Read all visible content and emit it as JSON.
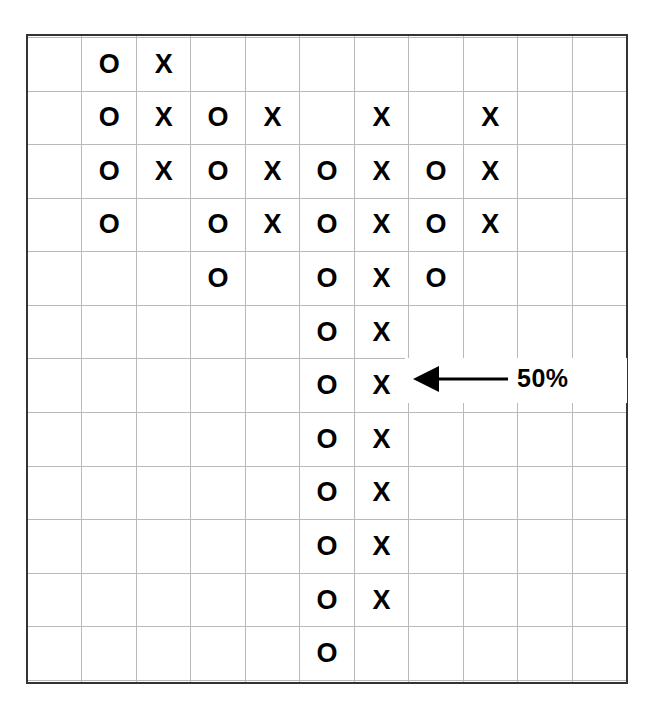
{
  "figure": {
    "kind": "pictograph-grid",
    "background_color": "#ffffff",
    "grid_line_color": "#b9b9b9",
    "frame_color": "#333333",
    "mark_color": "#000000"
  },
  "annotation": {
    "label": "50%",
    "arrow_icon": "left-arrow-icon",
    "arrow_direction": "left",
    "points_to": {
      "row": 8,
      "column": 7,
      "symbol": "X"
    }
  },
  "chart_data": {
    "type": "table",
    "title": "",
    "xlabel": "",
    "ylabel": "",
    "columns": 11,
    "rows": 14,
    "legend": [
      "O",
      "X"
    ],
    "annotations": [
      {
        "text": "50%",
        "arrow": "left",
        "target_row": 8,
        "target_column": 7
      }
    ],
    "counts": {
      "O": 24,
      "X": 22,
      "blank": 108
    },
    "cells": [
      [
        "",
        "",
        "",
        "",
        "",
        "",
        "",
        "",
        "",
        "",
        ""
      ],
      [
        "",
        "O",
        "X",
        "",
        "",
        "",
        "",
        "",
        "",
        "",
        ""
      ],
      [
        "",
        "O",
        "X",
        "O",
        "X",
        "",
        "X",
        "",
        "X",
        "",
        ""
      ],
      [
        "",
        "O",
        "X",
        "O",
        "X",
        "O",
        "X",
        "O",
        "X",
        "",
        ""
      ],
      [
        "",
        "O",
        "",
        "O",
        "X",
        "O",
        "X",
        "O",
        "X",
        "",
        ""
      ],
      [
        "",
        "",
        "",
        "O",
        "",
        "O",
        "X",
        "O",
        "",
        "",
        ""
      ],
      [
        "",
        "",
        "",
        "",
        "",
        "O",
        "X",
        "",
        "",
        "",
        ""
      ],
      [
        "",
        "",
        "",
        "",
        "",
        "O",
        "X",
        "",
        "",
        "",
        ""
      ],
      [
        "",
        "",
        "",
        "",
        "",
        "O",
        "X",
        "",
        "",
        "",
        ""
      ],
      [
        "",
        "",
        "",
        "",
        "",
        "O",
        "X",
        "",
        "",
        "",
        ""
      ],
      [
        "",
        "",
        "",
        "",
        "",
        "O",
        "X",
        "",
        "",
        "",
        ""
      ],
      [
        "",
        "",
        "",
        "",
        "",
        "O",
        "X",
        "",
        "",
        "",
        ""
      ],
      [
        "",
        "",
        "",
        "",
        "",
        "O",
        "",
        "",
        "",
        "",
        ""
      ],
      [
        "",
        "",
        "",
        "",
        "",
        "",
        "",
        "",
        "",
        "",
        ""
      ]
    ]
  }
}
